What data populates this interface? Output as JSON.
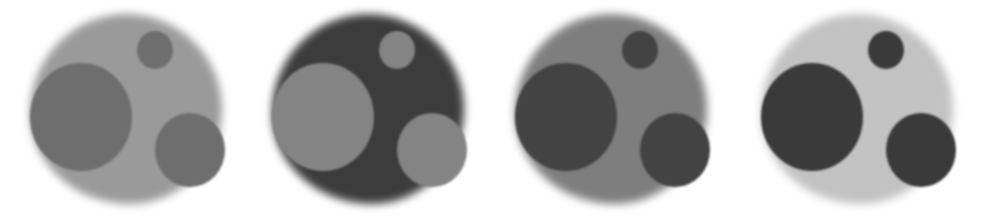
{
  "image": {
    "description": "Four grayscale phantom images, each a large blurred disc containing three inner discs (one large left, one small top-right, one medium bottom-right) with varying contrast",
    "panels": [
      {
        "background": "#ffffff",
        "blob": "#9a9a9a",
        "big": "#6e6e6e",
        "small": "#6e6e6e",
        "right": "#6e6e6e"
      },
      {
        "background": "#ffffff",
        "blob": "#3c3c3c",
        "big": "#848484",
        "small": "#848484",
        "right": "#848484"
      },
      {
        "background": "#ffffff",
        "blob": "#7e7e7e",
        "big": "#434343",
        "small": "#434343",
        "right": "#434343"
      },
      {
        "background": "#ffffff",
        "blob": "#c2c2c2",
        "big": "#3a3a3a",
        "small": "#3a3a3a",
        "right": "#3a3a3a"
      }
    ]
  }
}
